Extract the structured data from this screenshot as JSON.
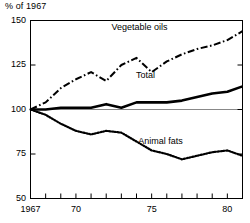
{
  "chart_data": {
    "type": "line",
    "title": "",
    "ylabel": "% of 1967",
    "xlabel": "",
    "ylim": [
      50,
      150
    ],
    "xlim": [
      1967,
      1981
    ],
    "grid": false,
    "reference_line": 100,
    "legend_position": "inline-labels",
    "ytick_labels": [
      "150",
      "125",
      "100",
      "75",
      "50"
    ],
    "ytick_values": [
      150,
      125,
      100,
      75,
      50
    ],
    "xtick_labels": [
      "1967",
      "70",
      "75",
      "80"
    ],
    "xtick_label_values": [
      1967,
      1970,
      1975,
      1980
    ],
    "xtick_values": [
      1967,
      1968,
      1969,
      1970,
      1971,
      1972,
      1973,
      1974,
      1975,
      1976,
      1977,
      1978,
      1979,
      1980,
      1981
    ],
    "x": [
      1967,
      1968,
      1969,
      1970,
      1971,
      1972,
      1973,
      1974,
      1975,
      1976,
      1977,
      1978,
      1979,
      1980,
      1981
    ],
    "series": [
      {
        "name": "Vegetable oils",
        "style": "dash-dot",
        "color": "#000000",
        "values": [
          100,
          104,
          112,
          117,
          121,
          116,
          125,
          129,
          121,
          127,
          131,
          134,
          136,
          139,
          144
        ]
      },
      {
        "name": "Total",
        "style": "solid",
        "color": "#000000",
        "values": [
          100,
          100,
          101,
          101,
          101,
          103,
          101,
          104,
          104,
          104,
          105,
          107,
          109,
          110,
          113
        ]
      },
      {
        "name": "Animal fats",
        "style": "dotted",
        "color": "#000000",
        "values": [
          100,
          97,
          92,
          88,
          86,
          88,
          87,
          82,
          77,
          75,
          72,
          74,
          76,
          77,
          74
        ]
      }
    ],
    "annotations": [
      {
        "text": "Vegetable oils",
        "x": 1974.2,
        "y": 146
      },
      {
        "text": "Total",
        "x": 1974.6,
        "y": 119
      },
      {
        "text": "Animal fats",
        "x": 1975.6,
        "y": 82
      }
    ]
  }
}
